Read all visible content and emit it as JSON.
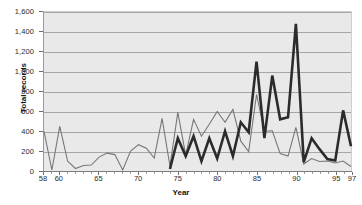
{
  "chart_data": {
    "type": "line",
    "title": "",
    "xlabel": "Year",
    "ylabel": "Total records",
    "xlim": [
      58,
      97
    ],
    "ylim": [
      0,
      1600
    ],
    "ytick_labels": [
      "0",
      "200",
      "400",
      "600",
      "800",
      "1,000",
      "1,200",
      "1,400",
      "1,600"
    ],
    "ytick_values": [
      0,
      200,
      400,
      600,
      800,
      1000,
      1200,
      1400,
      1600
    ],
    "xtick_labels": [
      "58",
      "60",
      "65",
      "70",
      "75",
      "80",
      "85",
      "90",
      "95",
      "97"
    ],
    "xtick_values": [
      58,
      60,
      65,
      70,
      75,
      80,
      85,
      90,
      95,
      97
    ],
    "grid": "horizontal",
    "legend": "none",
    "plot_background": "#e9e9e9",
    "series": [
      {
        "name": "thin-gray-series",
        "color": "#767676",
        "style": "thin",
        "x": [
          58,
          59,
          60,
          61,
          62,
          63,
          64,
          65,
          66,
          67,
          68,
          69,
          70,
          71,
          72,
          73,
          74,
          75,
          76,
          77,
          78,
          79,
          80,
          81,
          82,
          83,
          84,
          85,
          86,
          87,
          88,
          89,
          90,
          91,
          92,
          93,
          94,
          95,
          96,
          97
        ],
        "values": [
          400,
          10,
          450,
          100,
          25,
          55,
          60,
          140,
          180,
          165,
          10,
          200,
          265,
          230,
          130,
          530,
          50,
          590,
          160,
          520,
          350,
          470,
          600,
          490,
          620,
          300,
          195,
          770,
          400,
          405,
          175,
          150,
          440,
          70,
          125,
          95,
          100,
          80,
          100,
          45
        ]
      },
      {
        "name": "thick-dark-series",
        "color": "#2b2b2b",
        "style": "thick",
        "x": [
          74,
          75,
          76,
          77,
          78,
          79,
          80,
          81,
          82,
          83,
          84,
          85,
          86,
          87,
          88,
          89,
          90,
          91,
          92,
          93,
          94,
          95,
          96,
          97
        ],
        "values": [
          20,
          330,
          150,
          350,
          100,
          330,
          125,
          400,
          150,
          490,
          390,
          1100,
          330,
          960,
          520,
          540,
          1480,
          90,
          330,
          220,
          120,
          105,
          610,
          250
        ]
      }
    ]
  },
  "axes": {
    "y_title": "Total records",
    "x_title": "Year"
  }
}
